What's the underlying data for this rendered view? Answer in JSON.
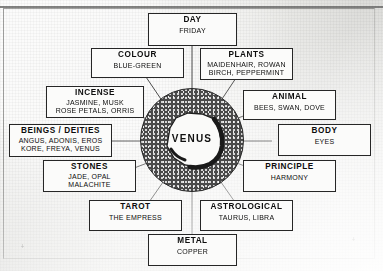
{
  "diagram": {
    "type": "radial-correspondence",
    "center": {
      "label": "VENUS",
      "shape": "stippled-ring-with-irregular-core"
    },
    "nodes": [
      {
        "id": "day",
        "title": "DAY",
        "values": [
          "FRIDAY"
        ]
      },
      {
        "id": "colour",
        "title": "COLOUR",
        "values": [
          "BLUE-GREEN"
        ]
      },
      {
        "id": "plants",
        "title": "PLANTS",
        "values": [
          "MAIDENHAIR, ROWAN",
          "BIRCH, PEPPERMINT"
        ]
      },
      {
        "id": "incense",
        "title": "INCENSE",
        "values": [
          "JASMINE, MUSK",
          "ROSE PETALS, ORRIS"
        ]
      },
      {
        "id": "animal",
        "title": "ANIMAL",
        "values": [
          "BEES, SWAN, DOVE"
        ]
      },
      {
        "id": "beings",
        "title": "BEINGS / DEITIES",
        "values": [
          "ANGUS, ADONIS, EROS",
          "KORE, FREYA, VENUS"
        ]
      },
      {
        "id": "body",
        "title": "BODY",
        "values": [
          "EYES"
        ]
      },
      {
        "id": "stones",
        "title": "STONES",
        "values": [
          "JADE, OPAL",
          "MALACHITE"
        ]
      },
      {
        "id": "principle",
        "title": "PRINCIPLE",
        "values": [
          "HARMONY"
        ]
      },
      {
        "id": "tarot",
        "title": "TAROT",
        "values": [
          "THE EMPRESS"
        ]
      },
      {
        "id": "astrological",
        "title": "ASTROLOGICAL",
        "values": [
          "TAURUS, LIBRA"
        ]
      },
      {
        "id": "metal",
        "title": "METAL",
        "values": [
          "COPPER"
        ]
      }
    ],
    "colors": {
      "paper": "#e5e5e2",
      "box_fill": "#fbfbfa",
      "box_border": "#262626",
      "ring_fill": "#4a4a4a",
      "text": "#0d0d0d",
      "connector": "#3a3a3a"
    }
  }
}
